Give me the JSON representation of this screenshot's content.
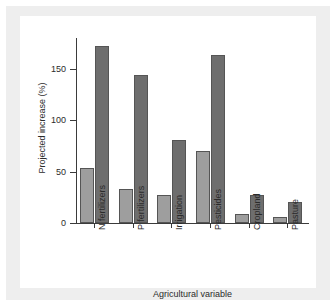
{
  "chart_data": {
    "type": "bar",
    "title": "",
    "xlabel": "Agricultural variable",
    "ylabel": "Projected increase (%)",
    "categories": [
      "N fertilizers",
      "P fertilizers",
      "Irrigation",
      "Pesticides",
      "Cropland",
      "Pasture"
    ],
    "series": [
      {
        "name": "series-1",
        "color": "#9e9e9e",
        "values": [
          54,
          33,
          27,
          70,
          9,
          6
        ]
      },
      {
        "name": "series-2",
        "color": "#6e6e6e",
        "values": [
          172,
          144,
          81,
          163,
          27,
          20
        ]
      }
    ],
    "ylim": [
      0,
      180
    ],
    "yticks": [
      0,
      50,
      100,
      150
    ],
    "ytick_labels": [
      "0",
      "50",
      "100",
      "150"
    ],
    "grid": false,
    "legend": "none"
  },
  "colors": {
    "page_background": "#ffffff",
    "card_background": "#eeeeee",
    "panel_background": "#ffffff",
    "axis": "#3b3b3b",
    "text": "#2b2b2b",
    "bar_light": "#9e9e9e",
    "bar_dark": "#6e6e6e",
    "bar_edge": "#555555"
  }
}
